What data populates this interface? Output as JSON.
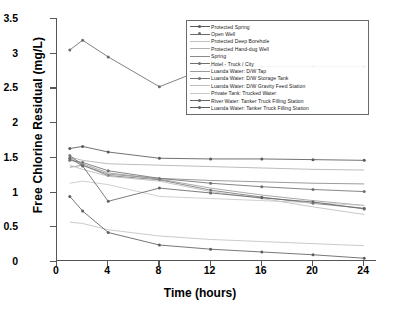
{
  "chart_data": {
    "type": "line",
    "title": "",
    "xlabel": "Time (hours)",
    "ylabel": "Free Chlorine Residual (mg/L)",
    "xlim": [
      0,
      25
    ],
    "ylim": [
      0,
      3.5
    ],
    "xticks": [
      "0",
      "4",
      "8",
      "12",
      "16",
      "20",
      "24"
    ],
    "yticks": [
      "0",
      "0.5",
      "1",
      "1.5",
      "2",
      "2.5",
      "3",
      "3.5"
    ],
    "grid": false,
    "legend_position": "upper-right-inside",
    "x": [
      1,
      2,
      4,
      8,
      12,
      16,
      20,
      24
    ],
    "series": [
      {
        "name": "Protected Spring",
        "color": "#5a5a5a",
        "marker": "circle",
        "values": [
          1.62,
          1.65,
          1.57,
          1.48,
          1.47,
          1.47,
          1.46,
          1.45
        ]
      },
      {
        "name": "Open Well",
        "color": "#6b6b6b",
        "marker": "circle",
        "values": [
          3.04,
          3.18,
          2.94,
          2.51,
          2.8,
          2.8,
          2.8,
          2.8
        ]
      },
      {
        "name": "Protected Deep Borehole",
        "color": "#c2c2c2",
        "marker": "none",
        "values": [
          0.56,
          0.54,
          0.45,
          0.36,
          0.31,
          0.28,
          0.25,
          0.22
        ]
      },
      {
        "name": "Protected Hand-dug Well",
        "color": "#b0b0b0",
        "marker": "none",
        "values": [
          1.5,
          1.45,
          1.4,
          1.38,
          1.36,
          1.34,
          1.32,
          1.31
        ]
      },
      {
        "name": "Spring",
        "color": "#8a8a8a",
        "marker": "none",
        "values": [
          1.35,
          1.38,
          1.25,
          1.19,
          1.16,
          1.14,
          1.12,
          1.11
        ]
      },
      {
        "name": "Hotel - Truck / City",
        "color": "#707070",
        "marker": "circle",
        "values": [
          1.45,
          1.42,
          1.3,
          1.19,
          1.12,
          1.07,
          1.03,
          1.0
        ]
      },
      {
        "name": "Luanda Water:  D/W Tap",
        "color": "#9b9b9b",
        "marker": "none",
        "values": [
          1.5,
          1.4,
          1.27,
          1.18,
          1.05,
          0.95,
          0.87,
          0.8
        ]
      },
      {
        "name": "Luanda Water:  D/W Storage Tank",
        "color": "#777777",
        "marker": "circle",
        "values": [
          1.52,
          1.38,
          1.23,
          1.17,
          1.02,
          0.92,
          0.83,
          0.76
        ]
      },
      {
        "name": "Luanda Water:  D/W Gravity Feed Station",
        "color": "#bdbdbd",
        "marker": "none",
        "values": [
          1.38,
          1.32,
          1.22,
          1.15,
          1.0,
          0.9,
          0.78,
          0.67
        ]
      },
      {
        "name": "Private Tank:  Trucked Water",
        "color": "#c8c8c8",
        "marker": "none",
        "values": [
          1.12,
          1.15,
          1.1,
          0.93,
          0.9,
          0.87,
          0.84,
          0.8
        ]
      },
      {
        "name": "River Water:  Tanker Truck Filling Station",
        "color": "#666666",
        "marker": "circle",
        "values": [
          1.48,
          1.37,
          0.86,
          1.05,
          0.98,
          0.91,
          0.85,
          0.75
        ]
      },
      {
        "name": "Luanda Water:  Tanker Truck Filling Station",
        "color": "#5f5f5f",
        "marker": "circle",
        "values": [
          0.93,
          0.72,
          0.41,
          0.23,
          0.17,
          0.13,
          0.09,
          0.04
        ]
      }
    ]
  }
}
